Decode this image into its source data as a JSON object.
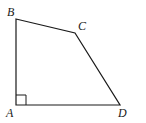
{
  "diagram": {
    "type": "quadrilateral",
    "vertices": {
      "A": {
        "label": "A",
        "x": 16,
        "y": 105
      },
      "B": {
        "label": "B",
        "x": 16,
        "y": 19
      },
      "C": {
        "label": "C",
        "x": 75,
        "y": 33
      },
      "D": {
        "label": "D",
        "x": 120,
        "y": 105
      }
    },
    "right_angle_at": "A",
    "stroke_color": "#1a1a1a",
    "background_color": "#ffffff"
  }
}
